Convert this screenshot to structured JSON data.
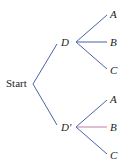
{
  "diagram": {
    "type": "tree-diagram",
    "root": {
      "label": "Start"
    },
    "level1": [
      {
        "label": "D",
        "children": [
          "A",
          "B",
          "C"
        ]
      },
      {
        "label": "D'",
        "children": [
          "A",
          "B",
          "C"
        ]
      }
    ],
    "colors": {
      "branch": "#4a63a8",
      "highlight_branch": "#c77aa8",
      "text": "#222222"
    },
    "highlighted_edge": "D' → B"
  }
}
